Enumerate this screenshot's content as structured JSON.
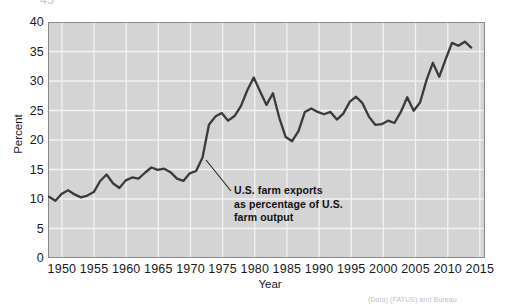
{
  "chart_data": {
    "type": "line",
    "title": "",
    "xlabel": "Year",
    "ylabel": "Percent",
    "xlim": [
      1948,
      2016
    ],
    "ylim": [
      0,
      40
    ],
    "xticks": [
      "1950",
      "1955",
      "1960",
      "1965",
      "1970",
      "1975",
      "1980",
      "1985",
      "1990",
      "1995",
      "2000",
      "2005",
      "2010",
      "2015"
    ],
    "yticks": [
      "0",
      "5",
      "10",
      "15",
      "20",
      "25",
      "30",
      "35",
      "40"
    ],
    "grid": true,
    "legend_position": "none",
    "plot_background": "#d4d4d4",
    "gridline_color": "#f2f2f2",
    "line_color": "#3a3a3a",
    "series": [
      {
        "name": "U.S. farm exports as percentage of U.S. farm output",
        "x": [
          1948,
          1949,
          1950,
          1951,
          1952,
          1953,
          1954,
          1955,
          1956,
          1957,
          1958,
          1959,
          1960,
          1961,
          1962,
          1963,
          1964,
          1965,
          1966,
          1967,
          1968,
          1969,
          1970,
          1971,
          1972,
          1973,
          1974,
          1975,
          1976,
          1977,
          1978,
          1979,
          1980,
          1981,
          1982,
          1983,
          1984,
          1985,
          1986,
          1987,
          1988,
          1989,
          1990,
          1991,
          1992,
          1993,
          1994,
          1995,
          1996,
          1997,
          1998,
          1999,
          2000,
          2001,
          2002,
          2003,
          2004,
          2005,
          2006,
          2007,
          2008,
          2009,
          2010,
          2011,
          2012,
          2013,
          2014
        ],
        "values": [
          10.3,
          9.6,
          10.8,
          11.4,
          10.7,
          10.2,
          10.5,
          11.1,
          13.0,
          14.1,
          12.6,
          11.8,
          13.1,
          13.6,
          13.4,
          14.4,
          15.3,
          14.9,
          15.1,
          14.5,
          13.4,
          13.0,
          14.3,
          14.7,
          17.0,
          22.6,
          24.0,
          24.6,
          23.3,
          24.1,
          25.8,
          28.5,
          30.7,
          28.3,
          26.0,
          28.0,
          23.8,
          20.5,
          19.8,
          21.5,
          24.8,
          25.4,
          24.8,
          24.4,
          24.8,
          23.5,
          24.5,
          26.5,
          27.4,
          26.3,
          24.0,
          22.6,
          22.7,
          23.3,
          22.9,
          24.8,
          27.3,
          25.0,
          26.4,
          30.2,
          33.2,
          30.8,
          33.8,
          36.6,
          36.1,
          36.8,
          35.8
        ]
      }
    ],
    "annotation": {
      "lines": [
        "U.S. farm exports",
        "as percentage of U.S.",
        "farm output"
      ],
      "leader_from": [
        206,
        160
      ],
      "leader_to": [
        231,
        191
      ]
    },
    "top_clipped_label": "45",
    "source_note": "(Data) (FATUS) and Bureau"
  }
}
